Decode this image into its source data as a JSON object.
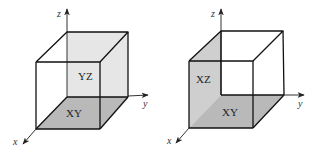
{
  "figure": {
    "colors": {
      "background": "#ffffff",
      "edge": "#111111",
      "axis": "#333333",
      "plane_yz": "#e6e6e6",
      "plane_xy": "#b9b9b9",
      "plane_xz": "#cfcfcf"
    },
    "cubes": [
      {
        "id": "left",
        "axes": {
          "x": "x",
          "y": "y",
          "z": "z"
        },
        "shaded_planes": [
          {
            "label": "YZ",
            "role": "back-face"
          },
          {
            "label": "XY",
            "role": "bottom-face"
          }
        ]
      },
      {
        "id": "right",
        "axes": {
          "x": "x",
          "y": "y",
          "z": "z"
        },
        "shaded_planes": [
          {
            "label": "XZ",
            "role": "left-face"
          },
          {
            "label": "XY",
            "role": "bottom-face"
          }
        ]
      }
    ]
  }
}
